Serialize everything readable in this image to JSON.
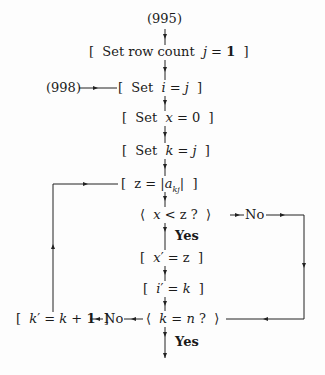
{
  "flowchart": {
    "entry_label": "(995)",
    "reentry_label": "(998)",
    "steps": {
      "set_row_count": "[ Set row count j = 1 ]",
      "set_i": "[ Set i = j ]",
      "set_x": "[ Set x = 0 ]",
      "set_k": "[ Set k = j ]",
      "set_z": "[ z = |akj| ]",
      "set_x_prime": "[ x' = z ]",
      "set_i_prime": "[ i' = k ]",
      "set_k_prime": "[ k' = k + 1 ]"
    },
    "decisions": {
      "x_lt_z": "⟨ x < z ? ⟩",
      "k_eq_n": "⟨ k = n ? ⟩"
    },
    "branch_labels": {
      "no_1": "No",
      "yes_1": "Yes",
      "no_2": "No",
      "yes_2": "Yes"
    }
  }
}
